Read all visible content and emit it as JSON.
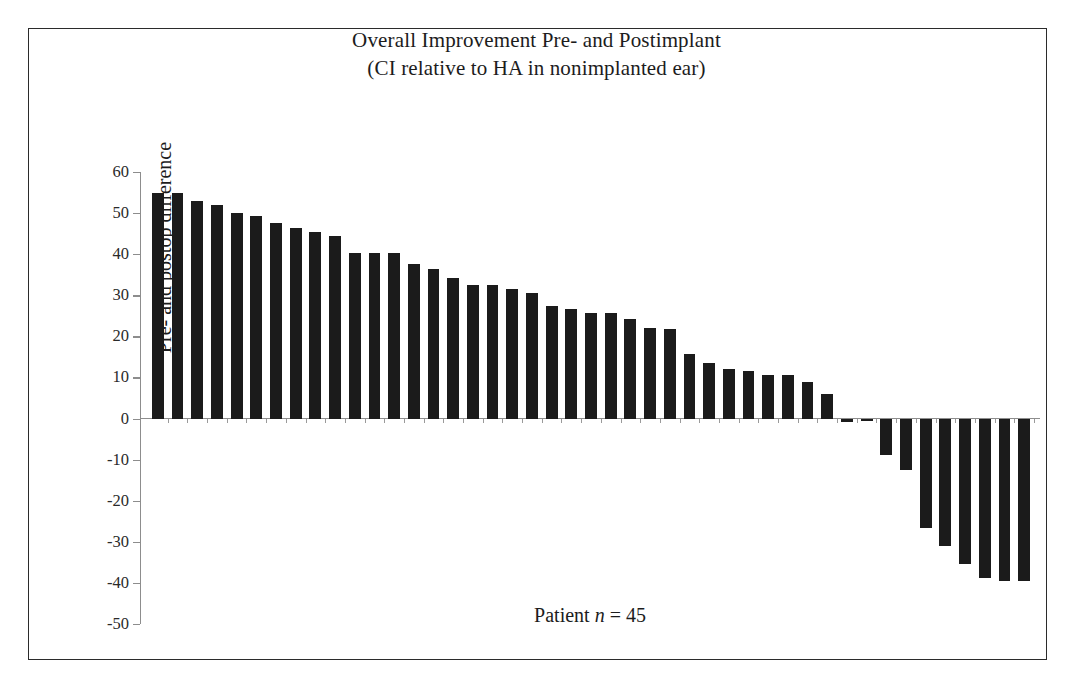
{
  "figure": {
    "title_line_1": "Overall Improvement Pre- and Postimplant",
    "title_line_2": "(CI relative to HA in nonimplanted ear)",
    "frame_color": "#2b2b2b",
    "background": "#ffffff"
  },
  "axis_caption": {
    "prefix": "Patient ",
    "italic_symbol": "n",
    "suffix": " = 45"
  },
  "chart_data": {
    "type": "bar",
    "title": "Overall Improvement Pre- and Postimplant (CI relative to HA in nonimplanted ear)",
    "xlabel": "Patient n = 45",
    "ylabel": "Pre- and postop difference",
    "ylim": [
      -50,
      60
    ],
    "ytick_labels": [
      "60",
      "50",
      "40",
      "30",
      "20",
      "10",
      "0",
      "-10",
      "-20",
      "-30",
      "-40",
      "-50"
    ],
    "yticks": [
      60,
      50,
      40,
      30,
      20,
      10,
      0,
      -10,
      -20,
      -30,
      -40,
      -50
    ],
    "grid": false,
    "legend": null,
    "bar_color": "#1b1b1b",
    "n_bars": 45,
    "categories": [
      "1",
      "2",
      "3",
      "4",
      "5",
      "6",
      "7",
      "8",
      "9",
      "10",
      "11",
      "12",
      "13",
      "14",
      "15",
      "16",
      "17",
      "18",
      "19",
      "20",
      "21",
      "22",
      "23",
      "24",
      "25",
      "26",
      "27",
      "28",
      "29",
      "30",
      "31",
      "32",
      "33",
      "34",
      "35",
      "36",
      "37",
      "38",
      "39",
      "40",
      "41",
      "42",
      "43",
      "44",
      "45"
    ],
    "values": [
      55.0,
      55.0,
      53.0,
      52.0,
      50.0,
      49.3,
      47.5,
      46.3,
      45.3,
      44.4,
      40.3,
      40.3,
      40.3,
      37.5,
      36.5,
      34.3,
      32.5,
      32.5,
      31.5,
      30.5,
      27.5,
      26.7,
      25.6,
      25.6,
      24.2,
      22.0,
      21.8,
      15.7,
      13.5,
      12.0,
      11.5,
      10.7,
      10.5,
      9.0,
      6.0,
      -0.8,
      -0.5,
      -8.8,
      -12.5,
      -26.6,
      -31.0,
      -35.5,
      -38.7,
      -39.5,
      -39.5
    ]
  }
}
